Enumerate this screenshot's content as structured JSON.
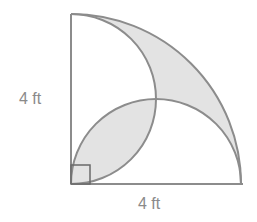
{
  "figure": {
    "type": "quarter-circle with two inscribed semicircles",
    "labels": {
      "vertical_side": "4 ft",
      "horizontal_side": "4 ft"
    },
    "colors": {
      "stroke": "#8c8c8c",
      "shade": "#e3e3e3",
      "background": "#ffffff"
    },
    "right_angle_marker": true
  }
}
